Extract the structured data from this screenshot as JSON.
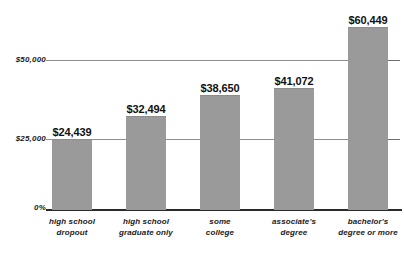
{
  "chart_data": {
    "type": "bar",
    "title": "",
    "subtitle": "",
    "xlabel": "",
    "ylabel": "",
    "categories": [
      "high school dropout",
      "high school graduate only",
      "some college",
      "associate's degree",
      "bachelor's degree or more"
    ],
    "category_lines": [
      [
        "high school",
        "dropout"
      ],
      [
        "high school",
        "graduate only"
      ],
      [
        "some",
        "college"
      ],
      [
        "associate's",
        "degree"
      ],
      [
        "bachelor's",
        "degree or more"
      ]
    ],
    "values": [
      24439,
      32494,
      38650,
      41072,
      60449
    ],
    "value_labels": [
      "$24,439",
      "$32,494",
      "$38,650",
      "$41,072",
      "$60,449"
    ],
    "ylim": [
      0,
      66000
    ],
    "yticks": [
      0,
      25000,
      50000
    ],
    "ytick_labels": [
      "0%",
      "$25,000",
      "$50,000"
    ],
    "grid": true,
    "gridlines_at": [
      25000,
      50000
    ],
    "legend": "none",
    "bar_color": "#9a9a9a",
    "gridline_color": "#8e8e8e",
    "axis_color": "#2a2a2a",
    "text_color": "#111111",
    "background": "#ffffff"
  },
  "bars": [
    {
      "label_lines": [
        "high school",
        "dropout"
      ],
      "value_label": "$24,439",
      "left": 52,
      "width": 40,
      "height": 70
    },
    {
      "label_lines": [
        "high school",
        "graduate only"
      ],
      "value_label": "$32,494",
      "left": 126,
      "width": 40,
      "height": 93
    },
    {
      "label_lines": [
        "some",
        "college"
      ],
      "value_label": "$38,650",
      "left": 200,
      "width": 40,
      "height": 114
    },
    {
      "label_lines": [
        "associate's",
        "degree"
      ],
      "value_label": "$41,072",
      "left": 274,
      "width": 40,
      "height": 121
    },
    {
      "label_lines": [
        "bachelor's",
        "degree or more"
      ],
      "value_label": "$60,449",
      "left": 348,
      "width": 40,
      "height": 182
    }
  ],
  "y_axis": {
    "top_label": "$50,000",
    "mid_label": "$25,000",
    "zero_label": "0%"
  }
}
